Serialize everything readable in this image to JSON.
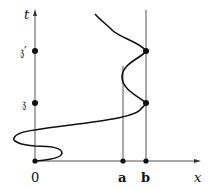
{
  "diagram": {
    "colors": {
      "stroke": "#111111",
      "thin": "#555555",
      "background": "#ffffff"
    },
    "axes": {
      "vertical_label": "t",
      "horizontal_label": "x",
      "origin_label": "0"
    },
    "t_axis_points": [
      {
        "label": "𝔷′",
        "name": "z-prime"
      },
      {
        "label": "𝔷",
        "name": "z"
      }
    ],
    "x_axis_points": [
      {
        "label": "a"
      },
      {
        "label": "b"
      }
    ],
    "curve": {
      "description": "Curve starting at origin, looping left across the t-axis twice, then sweeping right to touch line x=b at t=𝔷 and t=𝔷′, bulging toward x=a between them, continuing up-left."
    }
  }
}
